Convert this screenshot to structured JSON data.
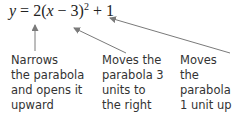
{
  "equation": {
    "lhs": "y",
    "eq": " = 2(",
    "var": "x",
    "mid": " − 3)",
    "exp": "2",
    "tail": " + 1"
  },
  "annotations": [
    {
      "text": "Narrows\nthe parabola\nand opens it\nupward",
      "points_to": "2"
    },
    {
      "text": "Moves the\nparabola 3\nunits to\nthe right",
      "points_to": "(x − 3)"
    },
    {
      "text": "Moves the\nparabola\n1 unit up",
      "points_to": "+ 1"
    }
  ],
  "colors": {
    "text": "#333333",
    "arrow": "#7a7a7a"
  }
}
